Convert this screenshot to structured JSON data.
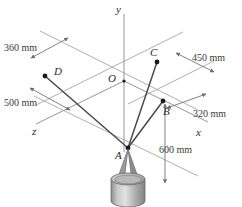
{
  "figure": {
    "background_color": "#ffffff",
    "line_color": "#6e6e6e",
    "axis_color": "#8a8a8a",
    "cable_color": "#555555",
    "point_color": "#1a1a1a",
    "text_color": "#2a2a2a"
  },
  "axes": [
    {
      "name": "y-axis",
      "label": "y",
      "x": 116,
      "y": 4
    },
    {
      "name": "x-axis",
      "label": "x",
      "x": 196,
      "y": 127
    },
    {
      "name": "z-axis",
      "label": "z",
      "x": 32,
      "y": 126
    }
  ],
  "points": [
    {
      "id": "O",
      "label": "O",
      "px": 124,
      "py": 81,
      "label_x": 108,
      "label_y": 73,
      "dot": false
    },
    {
      "id": "A",
      "label": "A",
      "px": 128,
      "py": 148,
      "label_x": 115,
      "label_y": 150,
      "dot": true
    },
    {
      "id": "B",
      "label": "B",
      "px": 163,
      "py": 101,
      "label_x": 163,
      "label_y": 106,
      "dot": true
    },
    {
      "id": "C",
      "label": "C",
      "px": 157,
      "py": 62,
      "label_x": 150,
      "label_y": 47,
      "dot": true
    },
    {
      "id": "D",
      "label": "D",
      "px": 45,
      "py": 76,
      "label_x": 54,
      "label_y": 66,
      "dot": true
    }
  ],
  "dimensions": [
    {
      "id": "dim-360",
      "label": "360 mm",
      "x": 4,
      "y": 43
    },
    {
      "id": "dim-500",
      "label": "500 mm",
      "x": 4,
      "y": 98
    },
    {
      "id": "dim-450",
      "label": "450 mm",
      "x": 192,
      "y": 53
    },
    {
      "id": "dim-320",
      "label": "320 mm",
      "x": 193,
      "y": 109
    },
    {
      "id": "dim-600",
      "label": "600 mm",
      "x": 159,
      "y": 145
    }
  ],
  "cables": [
    {
      "id": "cable-AB",
      "from": "A",
      "to": "B"
    },
    {
      "id": "cable-AC",
      "from": "A",
      "to": "C"
    },
    {
      "id": "cable-AD",
      "from": "A",
      "to": "D"
    }
  ],
  "weight": {
    "name": "cylindrical-weight",
    "cx": 128,
    "top_y": 178,
    "rx": 17,
    "ry": 6,
    "height": 24
  }
}
